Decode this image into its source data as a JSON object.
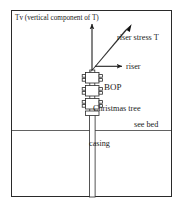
{
  "figure": {
    "background": "#ffffff",
    "line_color": "#2a2a2a",
    "text_color": "#1a1a1a",
    "frame": {
      "x": 11,
      "y": 10,
      "width": 161,
      "height": 187
    }
  },
  "labels": {
    "tv": "Tv (vertical component of T)",
    "riser_stress": "riser stress T",
    "riser": "riser",
    "bop": "BOP",
    "christmas_tree": "Christmas tree",
    "sea_bed": "see bed",
    "casing": "casing"
  },
  "diagram_elements": {
    "vertical_arrow": {
      "name": "Tv vertical component arrow",
      "from": [
        92,
        70
      ],
      "to": [
        92,
        22
      ],
      "direction": "up",
      "style": "thin"
    },
    "diagonal_arrow": {
      "name": "riser stress T arrow",
      "from": [
        92,
        70
      ],
      "to": [
        130,
        25
      ],
      "direction": "up-right",
      "style": "thick-tapered"
    },
    "horizontal_arrow": {
      "name": "riser pointer arrow",
      "from": [
        96,
        66
      ],
      "to": [
        123,
        66
      ],
      "direction": "right",
      "style": "thin"
    },
    "riser_pipe": {
      "x": 92,
      "top": 70,
      "bottom": 197,
      "width": 6
    },
    "bop_blocks": 3,
    "christmas_tree_flange": {
      "y": 112
    },
    "sea_bed_line": {
      "y": 130,
      "x_from": 12,
      "x_to": 171
    }
  }
}
